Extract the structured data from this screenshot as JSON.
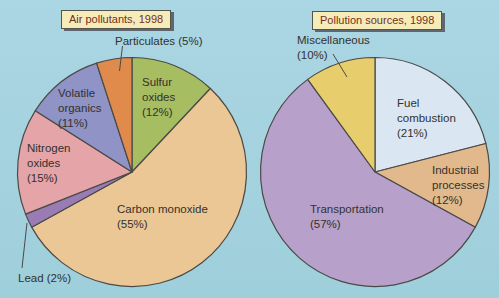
{
  "canvas": {
    "background": "#a5d2df",
    "slice_outline": "#4a4a46",
    "leader_line_color": "#4a4a46",
    "label_text_color": "#33312e",
    "title_text_color": "#733021",
    "title_box_background": "#f6ecba",
    "title_box_shadow": "#5e6670"
  },
  "chart_data": [
    {
      "type": "pie",
      "title": "Air pollutants, 1998",
      "categories": [
        "Sulfur oxides",
        "Carbon monoxide",
        "Lead",
        "Nitrogen oxides",
        "Volatile organics",
        "Particulates"
      ],
      "values": [
        12,
        55,
        2,
        15,
        11,
        5
      ],
      "colors": [
        "#a6bd62",
        "#ebc795",
        "#9a7cb5",
        "#e5a4a7",
        "#8f93c6",
        "#e08a4c"
      ],
      "start_angle_deg": 0,
      "direction": "clockwise",
      "slice_labels": [
        "Sulfur\noxides\n(12%)",
        "Carbon monoxide\n(55%)",
        "Lead (2%)",
        "Nitrogen\noxides\n(15%)",
        "Volatile\norganics\n(11%)",
        "Particulates (5%)"
      ]
    },
    {
      "type": "pie",
      "title": "Pollution sources, 1998",
      "categories": [
        "Fuel combustion",
        "Industrial processes",
        "Transportation",
        "Miscellaneous"
      ],
      "values": [
        21,
        12,
        57,
        10
      ],
      "colors": [
        "#dbe6f3",
        "#e2b98c",
        "#b7a1cb",
        "#e8cd6d"
      ],
      "start_angle_deg": 0,
      "direction": "clockwise",
      "slice_labels": [
        "Fuel\ncombustion\n(21%)",
        "Industrial\nprocesses\n(12%)",
        "Transportation\n(57%)",
        "Miscellaneous\n(10%)"
      ]
    }
  ]
}
